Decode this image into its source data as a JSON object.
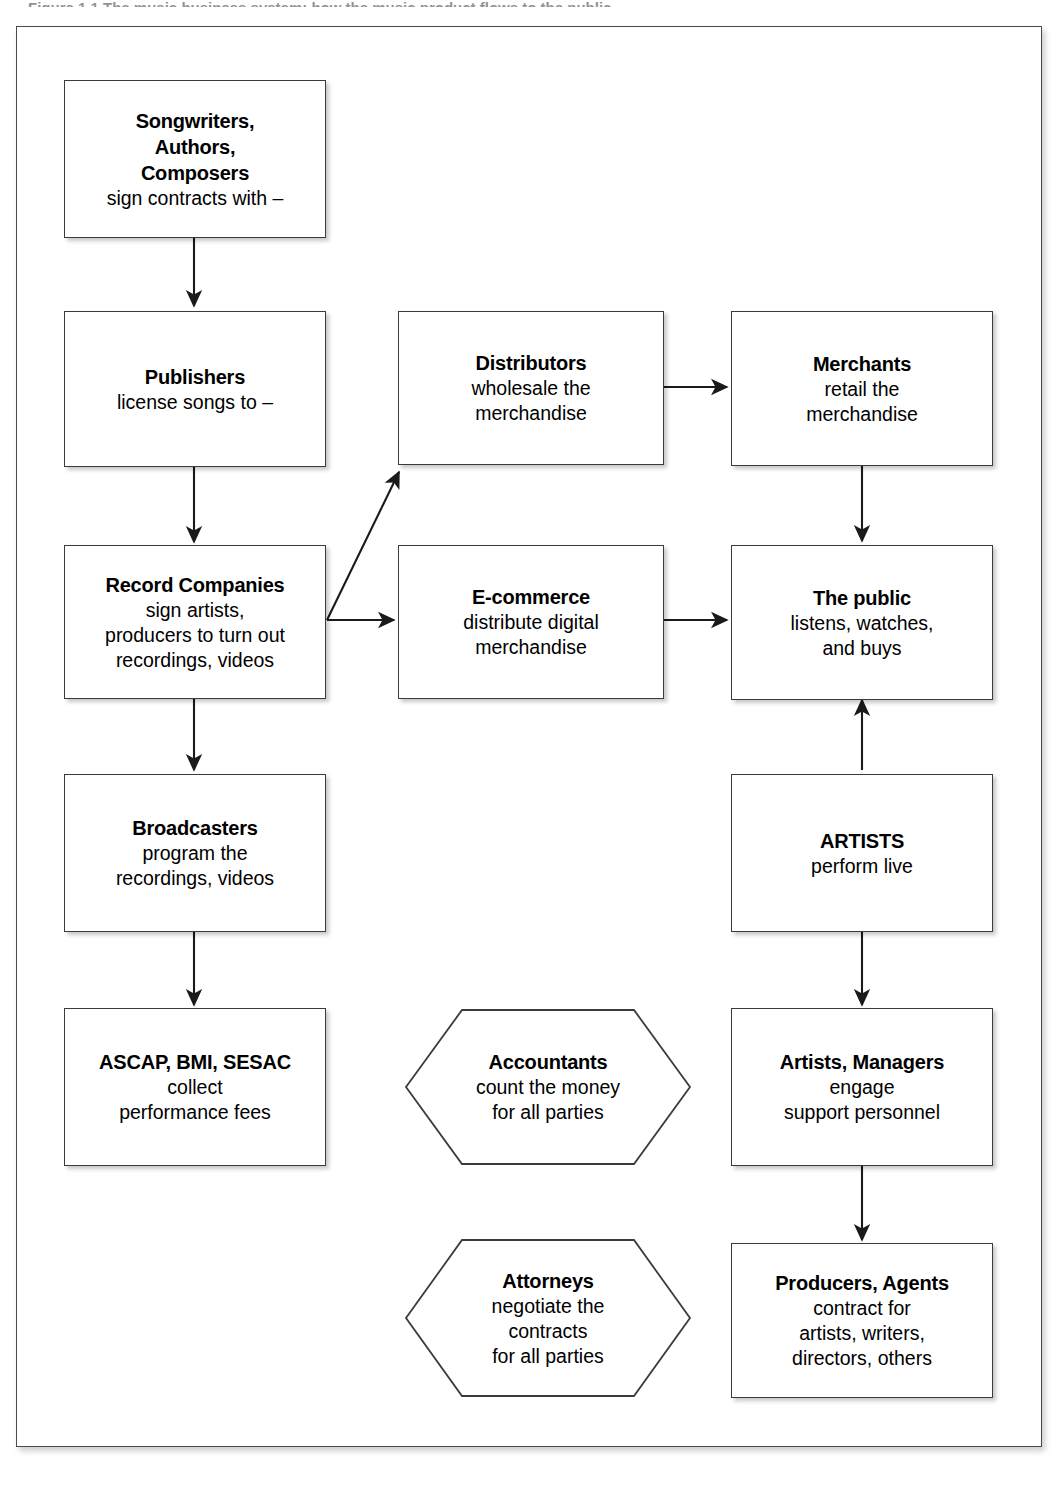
{
  "figure": {
    "caption_partial": "Figure 1.1   The music business system: how the music product flows to the public"
  },
  "diagram": {
    "nodes": [
      {
        "id": "songwriters",
        "shape": "box",
        "title": "Songwriters,\nAuthors,\nComposers",
        "title_lines": [
          "Songwriters,",
          "Authors,",
          "Composers"
        ],
        "sub_lines": [
          "sign contracts with –"
        ]
      },
      {
        "id": "publishers",
        "shape": "box",
        "title_lines": [
          "Publishers"
        ],
        "sub_lines": [
          "license songs to –"
        ]
      },
      {
        "id": "record-companies",
        "shape": "box",
        "title_lines": [
          "Record Companies"
        ],
        "sub_lines": [
          "sign artists,",
          "producers to turn out",
          "recordings, videos"
        ]
      },
      {
        "id": "broadcasters",
        "shape": "box",
        "title_lines": [
          "Broadcasters"
        ],
        "sub_lines": [
          "program the",
          "recordings, videos"
        ]
      },
      {
        "id": "ascap",
        "shape": "box",
        "title_lines": [
          "ASCAP, BMI, SESAC"
        ],
        "sub_lines": [
          "collect",
          "performance fees"
        ]
      },
      {
        "id": "distributors",
        "shape": "box",
        "title_lines": [
          "Distributors"
        ],
        "sub_lines": [
          "wholesale the",
          "merchandise"
        ]
      },
      {
        "id": "ecommerce",
        "shape": "box",
        "title_lines": [
          "E-commerce"
        ],
        "sub_lines": [
          "distribute digital",
          "merchandise"
        ]
      },
      {
        "id": "merchants",
        "shape": "box",
        "title_lines": [
          "Merchants"
        ],
        "sub_lines": [
          "retail the",
          "merchandise"
        ]
      },
      {
        "id": "the-public",
        "shape": "box",
        "title_lines": [
          "The public"
        ],
        "sub_lines": [
          "listens, watches,",
          "and buys"
        ]
      },
      {
        "id": "artists",
        "shape": "box",
        "title_lines": [
          "ARTISTS"
        ],
        "sub_lines": [
          "perform live"
        ]
      },
      {
        "id": "artists-managers",
        "shape": "box",
        "title_lines": [
          "Artists, Managers"
        ],
        "sub_lines": [
          "engage",
          "support personnel"
        ]
      },
      {
        "id": "producers-agents",
        "shape": "box",
        "title_lines": [
          "Producers, Agents"
        ],
        "sub_lines": [
          "contract for",
          "artists, writers,",
          "directors, others"
        ]
      },
      {
        "id": "accountants",
        "shape": "hexagon",
        "title_lines": [
          "Accountants"
        ],
        "sub_lines": [
          "count the money",
          "for all parties"
        ]
      },
      {
        "id": "attorneys",
        "shape": "hexagon",
        "title_lines": [
          "Attorneys"
        ],
        "sub_lines": [
          "negotiate the",
          "contracts",
          "for all parties"
        ]
      }
    ],
    "edges": [
      {
        "from": "songwriters",
        "to": "publishers",
        "type": "arrow-down"
      },
      {
        "from": "publishers",
        "to": "record-companies",
        "type": "arrow-down"
      },
      {
        "from": "record-companies",
        "to": "distributors",
        "type": "arrow-diagonal-up-right"
      },
      {
        "from": "record-companies",
        "to": "ecommerce",
        "type": "arrow-right"
      },
      {
        "from": "record-companies",
        "to": "broadcasters",
        "type": "arrow-down"
      },
      {
        "from": "broadcasters",
        "to": "ascap",
        "type": "arrow-down"
      },
      {
        "from": "distributors",
        "to": "merchants",
        "type": "arrow-right"
      },
      {
        "from": "merchants",
        "to": "the-public",
        "type": "arrow-down"
      },
      {
        "from": "ecommerce",
        "to": "the-public",
        "type": "arrow-right"
      },
      {
        "from": "artists",
        "to": "the-public",
        "type": "arrow-up"
      },
      {
        "from": "artists",
        "to": "artists-managers",
        "type": "arrow-down"
      },
      {
        "from": "artists-managers",
        "to": "producers-agents",
        "type": "arrow-down"
      }
    ]
  },
  "colors": {
    "frame_border": "#4a4a4a",
    "node_border": "#3b3b3b",
    "text": "#000000",
    "background": "#ffffff",
    "connector": "#1a1a1a"
  }
}
